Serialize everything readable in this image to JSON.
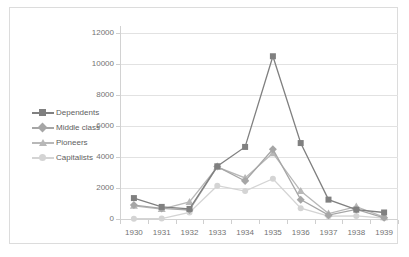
{
  "chart_data": {
    "type": "line",
    "title": "",
    "xlabel": "",
    "ylabel": "",
    "x": [
      1930,
      1931,
      1932,
      1933,
      1934,
      1935,
      1936,
      1937,
      1938,
      1939
    ],
    "categories": [
      "1930",
      "1931",
      "1932",
      "1933",
      "1934",
      "1935",
      "1936",
      "1937",
      "1938",
      "1939"
    ],
    "ylim": [
      0,
      12000
    ],
    "yticks": [
      0,
      2000,
      4000,
      6000,
      8000,
      10000,
      12000
    ],
    "ytick_labels": [
      "0",
      "2000",
      "4000",
      "6000",
      "8000",
      "10000",
      "12000"
    ],
    "grid": true,
    "legend_position": "left-inside",
    "series": [
      {
        "name": "Dependents",
        "color": "#808080",
        "marker": "square",
        "values": [
          1350,
          780,
          650,
          3400,
          4650,
          10500,
          4900,
          1250,
          600,
          420
        ]
      },
      {
        "name": "Middle class",
        "color": "#a6a6a6",
        "marker": "diamond",
        "values": [
          900,
          680,
          580,
          3380,
          2450,
          4500,
          1250,
          250,
          620,
          80
        ]
      },
      {
        "name": "Pioneers",
        "color": "#b8b8b8",
        "marker": "triangle",
        "values": [
          850,
          640,
          1100,
          3350,
          2650,
          4250,
          1800,
          350,
          800,
          120
        ]
      },
      {
        "name": "Capitalists",
        "color": "#d4d4d4",
        "marker": "circle",
        "values": [
          20,
          30,
          420,
          2150,
          1800,
          2600,
          700,
          180,
          200,
          60
        ]
      }
    ]
  },
  "legend": {
    "items": [
      {
        "label": "Dependents"
      },
      {
        "label": "Middle class"
      },
      {
        "label": "Pioneers"
      },
      {
        "label": "Capitalists"
      }
    ]
  },
  "colors": {
    "grid": "#e2e2e2",
    "axis": "#d2d2d2",
    "tick_text": "#737373",
    "legend_text": "#5e5e5e",
    "border": "#dcdcdc",
    "background": "#ffffff"
  }
}
